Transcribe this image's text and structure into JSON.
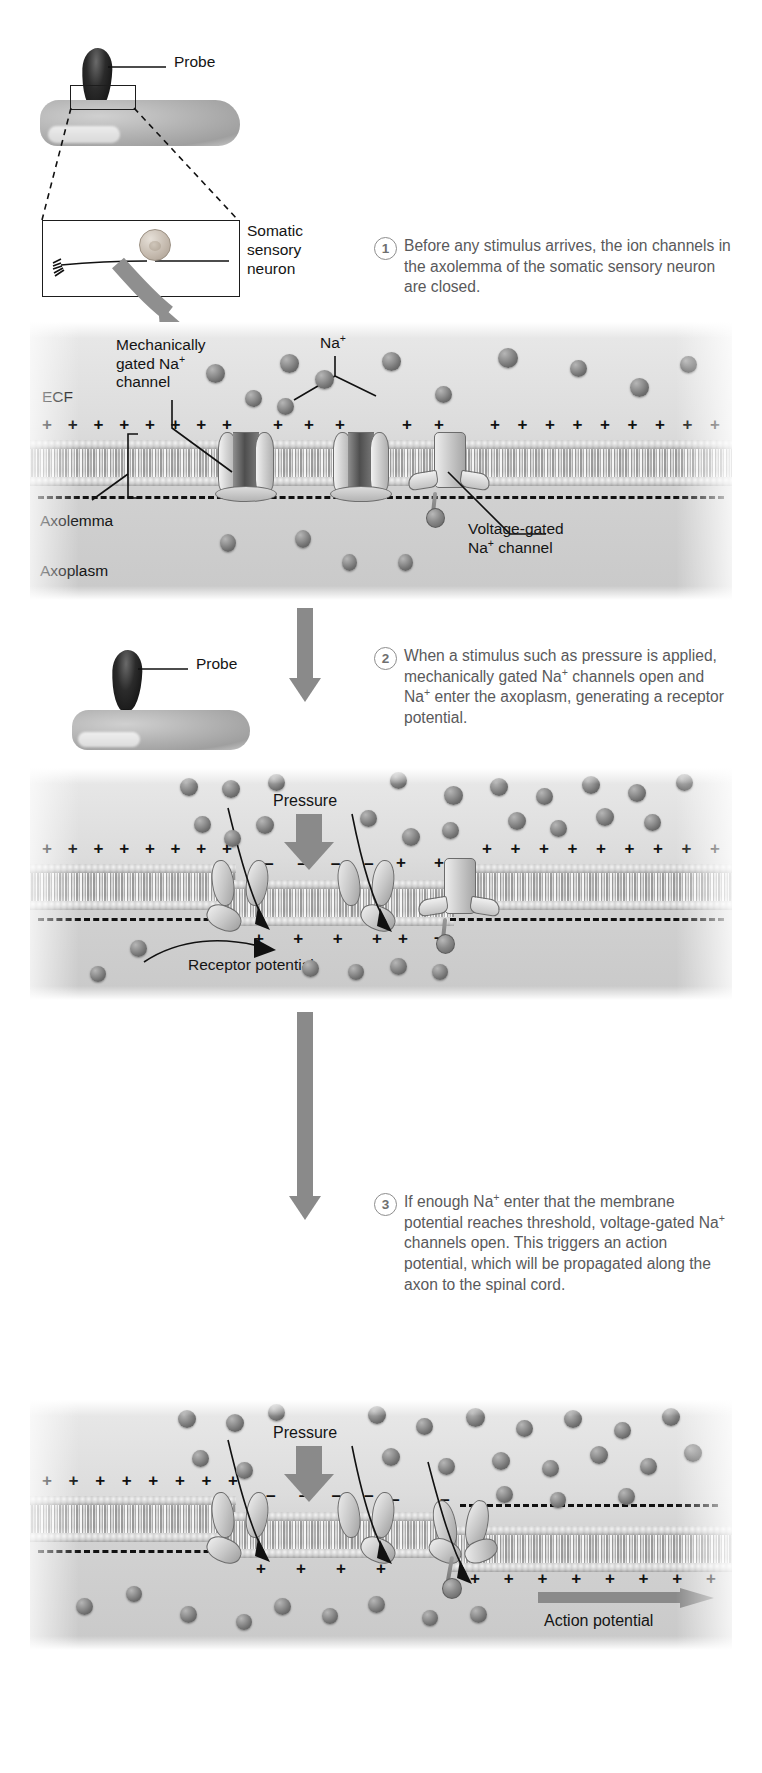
{
  "figure": {
    "domain": "biology-diagram"
  },
  "top_illustration": {
    "probe_label": "Probe",
    "neuron_label_lines": [
      "Somatic",
      "sensory",
      "neuron"
    ],
    "neuron_label": "Somatic sensory neuron"
  },
  "steps": [
    {
      "number": "1",
      "text": "Before any stimulus arrives, the ion channels in the axolemma of the somatic sensory neuron are closed."
    },
    {
      "number": "2",
      "text": "When a stimulus such as pressure is applied, mechanically gated Na+ channels open and Na+ enter the axoplasm, generating a receptor potential."
    },
    {
      "number": "3",
      "text": "If enough Na+ enter that the membrane potential reaches threshold, voltage-gated Na+ channels open. This triggers an action potential, which will be propagated along the axon to the spinal cord."
    }
  ],
  "panel1": {
    "labels": {
      "ecf": "ECF",
      "mechanically_gated_line1": "Mechanically",
      "mechanically_gated_line2": "gated Na",
      "mechanically_gated_line3": "channel",
      "na_ion": "Na",
      "axolemma": "Axolemma",
      "axoplasm": "Axoplasm",
      "voltage_gated_line1": "Voltage-gated",
      "voltage_gated_line2": "channel"
    },
    "charge_outside": "+",
    "charge_inside": "-"
  },
  "panel2": {
    "probe_label": "Probe",
    "pressure_label": "Pressure",
    "receptor_potential_label": "Receptor potential"
  },
  "panel3": {
    "pressure_label": "Pressure",
    "action_potential_label": "Action potential"
  },
  "superscript": "+",
  "colors": {
    "ion": "#6d6d6d",
    "membrane": "#c7c7c7",
    "panel_bg": "#dcdcdc",
    "step_text": "#59595b",
    "step_circle": "#8d8d8d",
    "label_text": "#141414",
    "arrow_grey": "#8a8a8a"
  }
}
